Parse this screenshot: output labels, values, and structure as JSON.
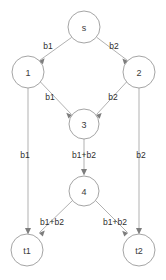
{
  "diagram": {
    "title": "",
    "type": "directed-graph",
    "background_color": "#ffffff",
    "node_stroke_color": "#9a9a9a",
    "edge_color": "#a8a8a8",
    "label_color": "#2e2e2e",
    "nodes": [
      {
        "id": "s",
        "label": "s",
        "cx": 84,
        "cy": 27,
        "r": 16
      },
      {
        "id": "1",
        "label": "1",
        "cx": 28,
        "cy": 72,
        "r": 16
      },
      {
        "id": "2",
        "label": "2",
        "cx": 139,
        "cy": 72,
        "r": 16
      },
      {
        "id": "3",
        "label": "3",
        "cx": 84,
        "cy": 124,
        "r": 15
      },
      {
        "id": "4",
        "label": "4",
        "cx": 84,
        "cy": 191,
        "r": 15
      },
      {
        "id": "t1",
        "label": "t1",
        "cx": 27,
        "cy": 250,
        "r": 16
      },
      {
        "id": "t2",
        "label": "t2",
        "cx": 139,
        "cy": 250,
        "r": 16
      }
    ],
    "edges": [
      {
        "from": "s",
        "to": "1",
        "label": "b1",
        "label_x": 48,
        "label_y": 46
      },
      {
        "from": "s",
        "to": "2",
        "label": "b2",
        "label_x": 114,
        "label_y": 46
      },
      {
        "from": "1",
        "to": "3",
        "label": "b1",
        "label_x": 50,
        "label_y": 97
      },
      {
        "from": "2",
        "to": "3",
        "label": "b2",
        "label_x": 113,
        "label_y": 97
      },
      {
        "from": "1",
        "to": "t1",
        "label": "b1",
        "label_x": 25,
        "label_y": 155
      },
      {
        "from": "3",
        "to": "4",
        "label": "b1+b2",
        "label_x": 84,
        "label_y": 155
      },
      {
        "from": "2",
        "to": "t2",
        "label": "b2",
        "label_x": 141,
        "label_y": 155
      },
      {
        "from": "4",
        "to": "t1",
        "label": "b1+b2",
        "label_x": 52,
        "label_y": 222
      },
      {
        "from": "4",
        "to": "t2",
        "label": "b1+b2",
        "label_x": 115,
        "label_y": 222
      }
    ]
  }
}
